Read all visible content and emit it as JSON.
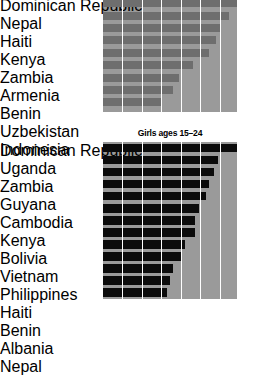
{
  "chart_data": [
    {
      "type": "bar",
      "orientation": "horizontal",
      "title": "",
      "xlabel": "",
      "ylabel": "",
      "grid": true,
      "gridline_count": 6,
      "bar_color": "#6e6e6e",
      "panel_color": "#9a9a9a",
      "xlim": [
        0,
        100
      ],
      "categories": [
        "Dominican Republic",
        "Nepal",
        "Haiti",
        "Kenya",
        "Zambia",
        "Armenia",
        "Benin",
        "Uzbekistan",
        "Indonesia"
      ],
      "values": [
        100,
        94,
        87,
        84,
        79,
        67,
        57,
        52,
        43
      ]
    },
    {
      "type": "bar",
      "orientation": "horizontal",
      "title": "Girls ages 15–24",
      "xlabel": "",
      "ylabel": "",
      "grid": true,
      "gridline_count": 6,
      "bar_color": "#0b0b0b",
      "panel_color": "#9a9a9a",
      "xlim": [
        0,
        100
      ],
      "categories": [
        "Dominican Republic",
        "Uganda",
        "Zambia",
        "Guyana",
        "Cambodia",
        "Kenya",
        "Bolivia",
        "Vietnam",
        "Philippines",
        "Haiti",
        "Benin",
        "Albania",
        "Nepal"
      ],
      "values": [
        100,
        86,
        83,
        79,
        77,
        72,
        69,
        69,
        61,
        59,
        52,
        50,
        48
      ]
    }
  ],
  "top_chart": {
    "title": "",
    "rows": [
      {
        "label": "Dominican Republic",
        "value": 100
      },
      {
        "label": "Nepal",
        "value": 94
      },
      {
        "label": "Haiti",
        "value": 87
      },
      {
        "label": "Kenya",
        "value": 84
      },
      {
        "label": "Zambia",
        "value": 79
      },
      {
        "label": "Armenia",
        "value": 67
      },
      {
        "label": "Benin",
        "value": 57
      },
      {
        "label": "Uzbekistan",
        "value": 52
      },
      {
        "label": "Indonesia",
        "value": 43
      }
    ]
  },
  "bottom_chart": {
    "title": "Girls ages 15–24",
    "rows": [
      {
        "label": "Dominican Republic",
        "value": 100
      },
      {
        "label": "Uganda",
        "value": 86
      },
      {
        "label": "Zambia",
        "value": 83
      },
      {
        "label": "Guyana",
        "value": 79
      },
      {
        "label": "Cambodia",
        "value": 77
      },
      {
        "label": "Kenya",
        "value": 72
      },
      {
        "label": "Bolivia",
        "value": 69
      },
      {
        "label": "Vietnam",
        "value": 69
      },
      {
        "label": "Philippines",
        "value": 61
      },
      {
        "label": "Haiti",
        "value": 59
      },
      {
        "label": "Benin",
        "value": 52
      },
      {
        "label": "Albania",
        "value": 50
      },
      {
        "label": "Nepal",
        "value": 48
      }
    ]
  }
}
